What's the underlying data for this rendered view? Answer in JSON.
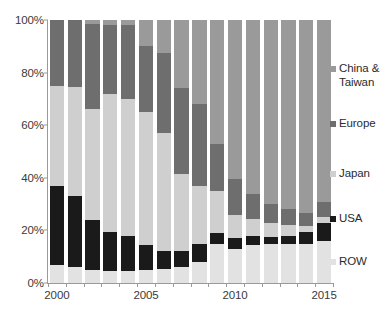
{
  "chart_data": {
    "type": "bar",
    "subtype": "stacked-100-percent",
    "title": "",
    "xlabel": "",
    "ylabel": "",
    "ylim": [
      0,
      100
    ],
    "yticks": [
      0,
      20,
      40,
      60,
      80,
      100
    ],
    "ytick_labels": [
      "0%",
      "20%",
      "40%",
      "60%",
      "80%",
      "100%"
    ],
    "grid": false,
    "legend_position": "right",
    "categories": [
      "2000",
      "2001",
      "2002",
      "2003",
      "2004",
      "2005",
      "2006",
      "2007",
      "2008",
      "2009",
      "2010",
      "2011",
      "2012",
      "2013",
      "2014",
      "2015"
    ],
    "xtick_labels": [
      "2000",
      "2005",
      "2010",
      "2015"
    ],
    "xtick_categories": [
      "2000",
      "2005",
      "2010",
      "2015"
    ],
    "series": [
      {
        "name": "ROW",
        "color": "#e2e2e2",
        "values": [
          7,
          6,
          5,
          4.5,
          4.5,
          5,
          5.5,
          6,
          8,
          15,
          13,
          14.5,
          15,
          15,
          15,
          16
        ]
      },
      {
        "name": "USA",
        "color": "#1a1a1a",
        "values": [
          30,
          27,
          19,
          15,
          13.5,
          9.5,
          6.5,
          6,
          7,
          4,
          4,
          3.5,
          2.5,
          3,
          4.5,
          7
        ]
      },
      {
        "name": "Japan",
        "color": "#cfcfcf",
        "values": [
          38,
          41.5,
          42,
          52.5,
          52,
          50.5,
          45,
          29.5,
          22,
          16,
          9,
          6.5,
          5.5,
          4,
          2,
          2
        ]
      },
      {
        "name": "Europe",
        "color": "#6e6e6e",
        "values": [
          25,
          25.5,
          32.5,
          26,
          28,
          25,
          30.5,
          32.5,
          31,
          18,
          13.5,
          9.5,
          7,
          6,
          5,
          6
        ]
      },
      {
        "name": "China & Taiwan",
        "color": "#9a9a9a",
        "values": [
          0,
          0,
          1.5,
          2,
          2,
          10,
          12.5,
          26,
          32,
          47,
          60.5,
          66,
          70,
          72,
          73.5,
          69
        ]
      }
    ]
  },
  "legend": {
    "items": [
      {
        "label": "China &\nTaiwan",
        "color": "#9a9a9a",
        "name": "china-taiwan"
      },
      {
        "label": "Europe",
        "color": "#6e6e6e",
        "name": "europe"
      },
      {
        "label": "Japan",
        "color": "#cfcfcf",
        "name": "japan"
      },
      {
        "label": "USA",
        "color": "#1a1a1a",
        "name": "usa"
      },
      {
        "label": "ROW",
        "color": "#e2e2e2",
        "name": "row"
      }
    ]
  },
  "colors": {
    "axis": "#9a9a9a",
    "text": "#3a3a3a",
    "background": "#ffffff"
  }
}
